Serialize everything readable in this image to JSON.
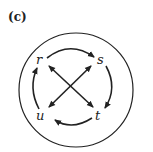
{
  "panel_label": "(c)",
  "nodes": {
    "r": "r",
    "s": "s",
    "t": "t",
    "u": "u"
  },
  "edges": [
    {
      "from": "r",
      "to": "s",
      "type": "arc"
    },
    {
      "from": "s",
      "to": "t",
      "type": "arc"
    },
    {
      "from": "t",
      "to": "u",
      "type": "arc"
    },
    {
      "from": "u",
      "to": "r",
      "type": "arc"
    },
    {
      "from": "r",
      "to": "t",
      "type": "double-arrow"
    },
    {
      "from": "u",
      "to": "s",
      "type": "double-arrow"
    }
  ]
}
